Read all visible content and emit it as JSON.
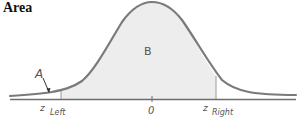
{
  "title": "Area",
  "diagram": {
    "type": "normal-distribution-area",
    "labels": {
      "region_left_tail": "A",
      "region_center": "B",
      "z_left_main": "z",
      "z_left_sub": "Left",
      "zero": "0",
      "z_right_main": "z",
      "z_right_sub": "Right"
    },
    "colors": {
      "curve": "#7a7a7a",
      "fill": "#ededed",
      "axis": "#6e6e6e",
      "label": "#555555"
    },
    "geometry": {
      "baseline_y": 99,
      "peak_x": 152,
      "peak_y": 3,
      "z_left_x": 61,
      "z_right_x": 216,
      "zero_x": 152
    }
  }
}
